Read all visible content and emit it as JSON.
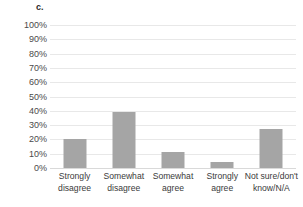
{
  "panel": {
    "label": "c."
  },
  "chart_data": {
    "type": "bar",
    "title": "",
    "subtitle": "",
    "xlabel": "",
    "ylabel": "",
    "categories": [
      "Strongly disagree",
      "Somewhat disagree",
      "Somewhat agree",
      "Strongly agree",
      "Not sure/don't know/N/A"
    ],
    "category_lines": [
      [
        "Strongly",
        "disagree"
      ],
      [
        "Somewhat",
        "disagree"
      ],
      [
        "Somewhat",
        "agree"
      ],
      [
        "Strongly",
        "agree"
      ],
      [
        "Not sure/don't",
        "know/N/A"
      ]
    ],
    "values": [
      20,
      39,
      11,
      4,
      27
    ],
    "value_labels": [
      "20%",
      "39%",
      "11%",
      "4%",
      "27%"
    ],
    "ylim": [
      0,
      100
    ],
    "ytick_labels": [
      "100%",
      "90%",
      "80%",
      "70%",
      "60%",
      "50%",
      "40%",
      "30%",
      "20%",
      "10%",
      "0%"
    ],
    "ytick_values": [
      100,
      90,
      80,
      70,
      60,
      50,
      40,
      30,
      20,
      10,
      0
    ],
    "grid": true,
    "legend": "none",
    "bar_color": "#a5a5a5",
    "gridline_color": "#e8e8e8",
    "background_color": "#ffffff"
  }
}
